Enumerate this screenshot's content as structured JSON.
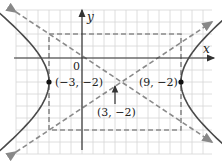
{
  "figure": {
    "type": "hyperbola-graph",
    "equation": "(x-3)^2/36 - (y+2)^2/16 = 1",
    "axes": {
      "x_label": "x",
      "y_label": "y",
      "origin_label": "0"
    },
    "center": {
      "x": 3,
      "y": -2,
      "label": "(3, −2)"
    },
    "vertices": [
      {
        "x": -3,
        "y": -2,
        "label": "(−3, −2)"
      },
      {
        "x": 9,
        "y": -2,
        "label": "(9, −2)"
      }
    ],
    "fundamental_rectangle": {
      "x_min": -3,
      "x_max": 9,
      "y_min": -6,
      "y_max": 2
    },
    "asymptotes": [
      "y + 2 = (2/3)(x - 3)",
      "y + 2 = -(2/3)(x - 3)"
    ],
    "grid": {
      "x_range": [
        -7,
        12
      ],
      "y_range": [
        -8,
        4
      ],
      "step": 1
    },
    "colors": {
      "grid": "#d4d4d4",
      "axis": "#333333",
      "curve": "#444444",
      "dashed": "#888888",
      "point": "#111111"
    }
  }
}
